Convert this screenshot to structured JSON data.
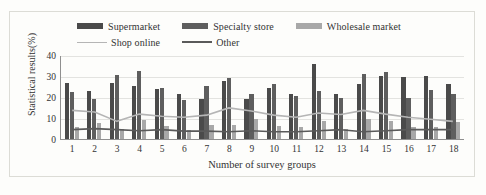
{
  "chart_data": {
    "type": "bar",
    "title": "",
    "xlabel": "Number of survey groups",
    "ylabel": "Statistical results(%)",
    "ylim": [
      0,
      40
    ],
    "yticks": [
      0,
      10,
      20,
      30,
      40
    ],
    "grid": true,
    "legend_position": "top",
    "categories": [
      "1",
      "2",
      "3",
      "4",
      "5",
      "6",
      "7",
      "8",
      "9",
      "10",
      "11",
      "12",
      "13",
      "14",
      "15",
      "16",
      "17",
      "18"
    ],
    "series": [
      {
        "name": "Supermarket",
        "kind": "bar",
        "color": "#4a4a4a",
        "values": [
          26.5,
          23.0,
          26.8,
          25.2,
          23.8,
          21.2,
          19.0,
          27.6,
          19.0,
          24.5,
          21.5,
          35.5,
          21.5,
          26.0,
          30.0,
          29.5,
          30.0,
          26.0
        ]
      },
      {
        "name": "Specialty store",
        "kind": "bar",
        "color": "#5e5e5e",
        "values": [
          22.5,
          19.2,
          30.5,
          32.5,
          24.3,
          18.5,
          25.2,
          29.0,
          21.5,
          26.0,
          20.5,
          23.0,
          19.5,
          31.0,
          32.0,
          19.5,
          23.5,
          21.5
        ]
      },
      {
        "name": "Wholesale market",
        "kind": "bar",
        "color": "#a8a8a8",
        "values": [
          5.5,
          7.8,
          5.0,
          9.0,
          6.0,
          4.5,
          6.5,
          6.5,
          9.5,
          6.0,
          5.5,
          8.5,
          5.0,
          9.5,
          8.5,
          5.5,
          5.5,
          8.0
        ]
      },
      {
        "name": "Shop online",
        "kind": "line",
        "color": "#b5b5b5",
        "values": [
          13.8,
          13.0,
          8.5,
          12.0,
          11.0,
          10.5,
          11.5,
          15.0,
          13.5,
          11.5,
          10.5,
          12.5,
          11.8,
          13.8,
          12.0,
          10.5,
          9.5,
          8.5
        ]
      },
      {
        "name": "Other",
        "kind": "line",
        "color": "#5a5a5a",
        "values": [
          4.5,
          5.0,
          4.5,
          4.0,
          4.5,
          3.8,
          3.8,
          3.5,
          4.0,
          3.5,
          3.5,
          4.0,
          4.5,
          3.5,
          4.0,
          4.5,
          4.5,
          4.5
        ]
      }
    ]
  },
  "legend": {
    "items": [
      {
        "label": "Supermarket",
        "marker": "bar",
        "color": "#4a4a4a"
      },
      {
        "label": "Specialty store",
        "marker": "bar",
        "color": "#5e5e5e"
      },
      {
        "label": "Wholesale market",
        "marker": "bar",
        "color": "#a8a8a8"
      },
      {
        "label": "Shop online",
        "marker": "line",
        "color": "#b5b5b5"
      },
      {
        "label": "Other",
        "marker": "line",
        "color": "#5a5a5a"
      }
    ]
  }
}
